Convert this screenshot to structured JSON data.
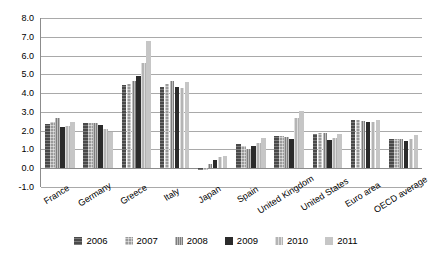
{
  "chart_data": {
    "type": "bar",
    "title": "",
    "subtitle": "",
    "xlabel": "",
    "ylabel": "",
    "ylim": [
      -1.0,
      8.0
    ],
    "ytick_step": 1.0,
    "ytick_labels": [
      "8.0",
      "7.0",
      "6.0",
      "5.0",
      "4.0",
      "3.0",
      "2.0",
      "1.0",
      "0.0",
      "-1.0"
    ],
    "grid": true,
    "legend_position": "bottom",
    "categories": [
      "France",
      "Germany",
      "Greece",
      "Italy",
      "Japan",
      "Spain",
      "United Kingdom",
      "United States",
      "Euro area",
      "OECD average"
    ],
    "series": [
      {
        "name": "2006",
        "color": "#4a4a4a",
        "values": [
          2.35,
          2.4,
          4.45,
          4.35,
          -0.1,
          1.3,
          1.7,
          1.85,
          2.55,
          1.55
        ]
      },
      {
        "name": "2007",
        "color": "#9a9a9a",
        "values": [
          2.45,
          2.4,
          4.5,
          4.5,
          -0.1,
          1.2,
          1.7,
          1.9,
          2.55,
          1.55
        ]
      },
      {
        "name": "2008",
        "color": "#7d7d7d",
        "values": [
          2.65,
          2.4,
          4.65,
          4.65,
          0.2,
          1.0,
          1.65,
          1.9,
          2.5,
          1.55
        ]
      },
      {
        "name": "2009",
        "color": "#2b2b2b",
        "values": [
          2.2,
          2.3,
          4.9,
          4.35,
          0.45,
          1.2,
          1.55,
          1.5,
          2.45,
          1.45
        ]
      },
      {
        "name": "2010",
        "color": "#b4b4b4",
        "values": [
          2.25,
          2.1,
          5.6,
          4.25,
          0.6,
          1.35,
          2.7,
          1.6,
          2.45,
          1.55
        ]
      },
      {
        "name": "2011",
        "color": "#c6c6c6",
        "values": [
          2.45,
          1.95,
          6.75,
          4.6,
          0.65,
          1.6,
          3.05,
          1.8,
          2.55,
          1.75
        ]
      }
    ]
  },
  "legend": {
    "entries": [
      "2006",
      "2007",
      "2008",
      "2009",
      "2010",
      "2011"
    ]
  }
}
